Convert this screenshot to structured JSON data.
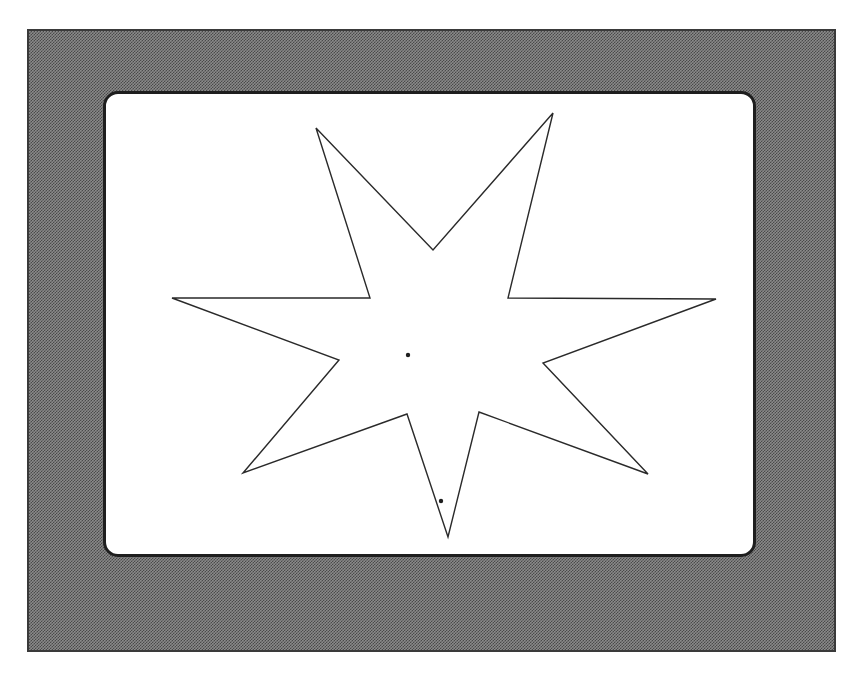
{
  "scene": {
    "description": "Seven-pointed star outline on a white display screen framed by a dithered gray border",
    "colors": {
      "frame_dark": "#4a4a4a",
      "frame_light": "#8a8a8a",
      "screen_bg": "#ffffff",
      "outline": "#2a2a2a"
    }
  },
  "star": {
    "points": "316,128 433,250 553,113 508,298 716,299 543,363 648,474 479,412 448,537 407,414 243,473 339,360 172,298 370,298",
    "stroke_width": 1.4
  },
  "markers": [
    {
      "name": "center-dot",
      "cx": 408,
      "cy": 355,
      "r": 2.2
    },
    {
      "name": "lower-dot",
      "cx": 441,
      "cy": 501,
      "r": 2.2
    }
  ]
}
